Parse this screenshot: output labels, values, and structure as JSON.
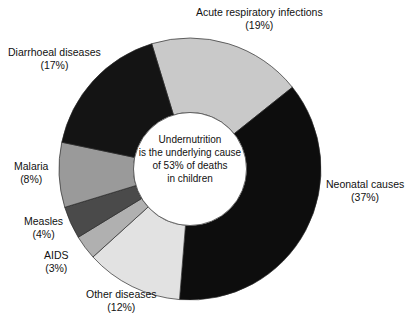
{
  "chart_data": {
    "type": "pie",
    "variant": "donut",
    "title": "",
    "subtitle": "",
    "xlabel": "",
    "ylabel": "",
    "grid": false,
    "legend_position": "none",
    "label_style": "outside-callout",
    "units": "percent",
    "start_angle_deg": -17,
    "direction": "clockwise",
    "categories": [
      "Acute respiratory infections",
      "Neonatal causes",
      "Other diseases",
      "AIDS",
      "Measles",
      "Malaria",
      "Diarrhoeal diseases"
    ],
    "values": [
      19,
      37,
      12,
      3,
      4,
      8,
      17
    ],
    "value_labels": [
      "(19%)",
      "(37%)",
      "(12%)",
      "(3%)",
      "(4%)",
      "(8%)",
      "(17%)"
    ],
    "colors": [
      "#c9c9c9",
      "#0d0d0d",
      "#e2e2e2",
      "#b0b0b0",
      "#4a4a4a",
      "#9a9a9a",
      "#141414"
    ],
    "slices": [
      {
        "label": "Acute respiratory infections",
        "value": 19,
        "value_label": "(19%)",
        "color": "#c9c9c9"
      },
      {
        "label": "Neonatal causes",
        "value": 37,
        "value_label": "(37%)",
        "color": "#0d0d0d"
      },
      {
        "label": "Other diseases",
        "value": 12,
        "value_label": "(12%)",
        "color": "#e2e2e2"
      },
      {
        "label": "AIDS",
        "value": 3,
        "value_label": "(3%)",
        "color": "#b0b0b0"
      },
      {
        "label": "Measles",
        "value": 4,
        "value_label": "(4%)",
        "color": "#4a4a4a"
      },
      {
        "label": "Malaria",
        "value": 8,
        "value_label": "(8%)",
        "color": "#9a9a9a"
      },
      {
        "label": "Diarrhoeal diseases",
        "value": 17,
        "value_label": "(17%)",
        "color": "#141414"
      }
    ],
    "annotations": [
      "Undernutrition",
      "is the underlying cause",
      "of 53% of deaths",
      "in children"
    ],
    "center_note": {
      "line1": "Undernutrition",
      "line2": "is the underlying cause",
      "line3": "of 53% of deaths",
      "line4": "in children"
    }
  }
}
